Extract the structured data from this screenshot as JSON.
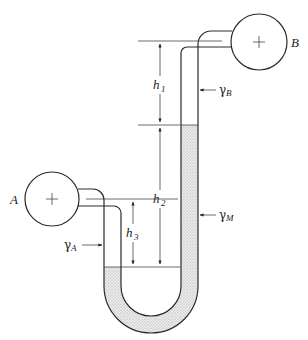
{
  "diagram": {
    "title": "",
    "vessels": [
      {
        "id": "A",
        "label": "A"
      },
      {
        "id": "B",
        "label": "B"
      }
    ],
    "dimensions": [
      {
        "id": "h1",
        "symbol": "h",
        "subscript": "1"
      },
      {
        "id": "h2",
        "symbol": "h",
        "subscript": "2"
      },
      {
        "id": "h3",
        "symbol": "h",
        "subscript": "3"
      }
    ],
    "fluids": [
      {
        "id": "gammaA",
        "symbol": "γ",
        "subscript": "A"
      },
      {
        "id": "gammaB",
        "symbol": "γ",
        "subscript": "B"
      },
      {
        "id": "gammaM",
        "symbol": "γ",
        "subscript": "M"
      }
    ],
    "colors": {
      "line": "#2a2a2a",
      "manometer_fluid": "#d4d4d4",
      "background": "#ffffff"
    }
  }
}
